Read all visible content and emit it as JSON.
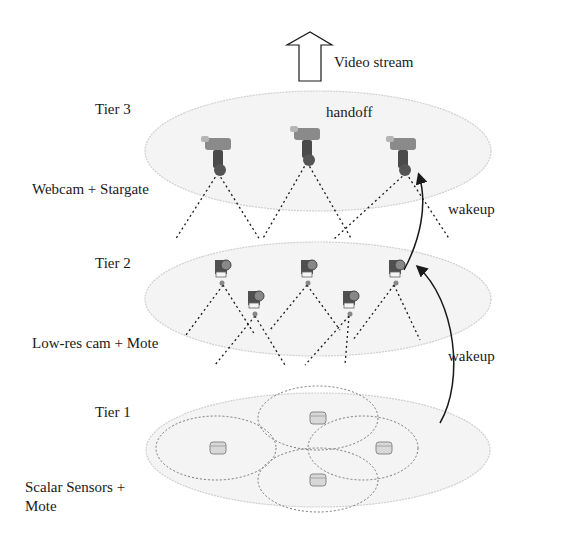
{
  "diagram": {
    "top_arrow_label": "Video stream",
    "handoff_label": "handoff",
    "wakeup_upper_label": "wakeup",
    "wakeup_lower_label": "wakeup",
    "tiers": [
      {
        "name": "Tier 3",
        "description": "Webcam + Stargate",
        "device": "webcam",
        "count": 3
      },
      {
        "name": "Tier 2",
        "description": "Low-res cam + Mote",
        "device": "low-res-camera",
        "count": 5
      },
      {
        "name": "Tier 1",
        "description_line1": "Scalar Sensors +",
        "description_line2": "Mote",
        "device": "scalar-sensor",
        "count": 4
      }
    ],
    "colors": {
      "ellipse_fill": "#f3f3f3",
      "ellipse_stroke": "#d0d0d0",
      "line": "#1a1a1a",
      "camera": "#555555"
    }
  }
}
